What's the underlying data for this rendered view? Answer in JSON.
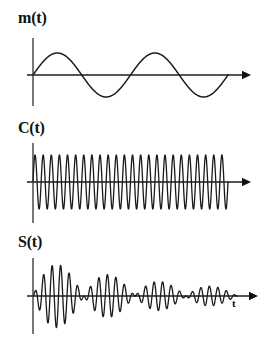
{
  "figure": {
    "title_visible": false,
    "background_color": "#ffffff",
    "width": 275,
    "height": 346,
    "curve_color": "#1a1a1a",
    "axis_color": "#555555",
    "text_color": "#111111"
  },
  "panels": [
    {
      "id": "message",
      "label": "m(t)",
      "label_x": 18,
      "label_y": 10,
      "axis_x": 33,
      "baseline_y": 75,
      "axis_top_y": 38,
      "axis_bottom_y": 106,
      "x_start": 33,
      "x_end": 228,
      "arrow_tip_x": 251,
      "amplitude": 22,
      "cycles": 2,
      "t_label": "",
      "t_label_x": 0,
      "t_label_y": 0
    },
    {
      "id": "carrier",
      "label": "C(t)",
      "label_x": 18,
      "label_y": 120,
      "axis_x": 33,
      "baseline_y": 182,
      "axis_top_y": 143,
      "axis_bottom_y": 223,
      "x_start": 33,
      "x_end": 228,
      "arrow_tip_x": 251,
      "amplitude": 27,
      "cycles": 24,
      "t_label": "",
      "t_label_x": 0,
      "t_label_y": 0
    },
    {
      "id": "modulated",
      "label": "S(t)",
      "label_x": 18,
      "label_y": 234,
      "axis_x": 33,
      "baseline_y": 296,
      "axis_top_y": 258,
      "axis_bottom_y": 334,
      "x_start": 33,
      "x_end": 237,
      "arrow_tip_x": 258,
      "amplitude": 38,
      "cycles": 24,
      "envelope_cycles": 2,
      "decay": 1.55,
      "t_label": "t",
      "t_label_x": 232,
      "t_label_y": 298
    }
  ],
  "chart_data": {
    "type": "line",
    "title": "",
    "xlabel": "t",
    "ylabel": "",
    "grid": false,
    "legend": "none",
    "series": [
      {
        "name": "m(t)",
        "waveform": "sine",
        "amplitude": 1.0,
        "cycles": 2,
        "phase": 0,
        "decay": 0,
        "ylim": [
          -1.2,
          1.2
        ],
        "xlim": [
          0,
          1
        ]
      },
      {
        "name": "C(t)",
        "waveform": "sine",
        "amplitude": 1.0,
        "cycles": 24,
        "phase": 0,
        "decay": 0,
        "ylim": [
          -1.2,
          1.2
        ],
        "xlim": [
          0,
          1
        ]
      },
      {
        "name": "S(t)",
        "waveform": "product",
        "amplitude": 1.0,
        "cycles": 24,
        "envelope_cycles": 2,
        "phase": 0,
        "decay": 1.55,
        "ylim": [
          -1.2,
          1.2
        ],
        "xlim": [
          0,
          1
        ]
      }
    ]
  }
}
